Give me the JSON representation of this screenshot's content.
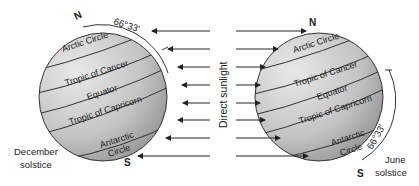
{
  "diagram": {
    "center_label": "Direct sunlight",
    "left_globe": {
      "caption_line1": "December",
      "caption_line2": "solstice",
      "north": "N",
      "south": "S",
      "angle": "66°33'",
      "lines": {
        "arctic": "Arctic Circle",
        "cancer": "Tropic of Cancer",
        "equator": "Equator",
        "capricorn": "Tropic of Capricorn",
        "antarctic_1": "Antarctic",
        "antarctic_2": "Circle"
      }
    },
    "right_globe": {
      "caption_line1": "June",
      "caption_line2": "solstice",
      "north": "N",
      "south": "S",
      "angle": "66°33'",
      "lines": {
        "arctic": "Arctic Circle",
        "cancer": "Tropic of Cancer",
        "equator": "Equator",
        "capricorn": "Tropic of Capricorn",
        "antarctic_1": "Antarctic",
        "antarctic_2": "Circle"
      }
    },
    "arrow_rows": 8
  }
}
